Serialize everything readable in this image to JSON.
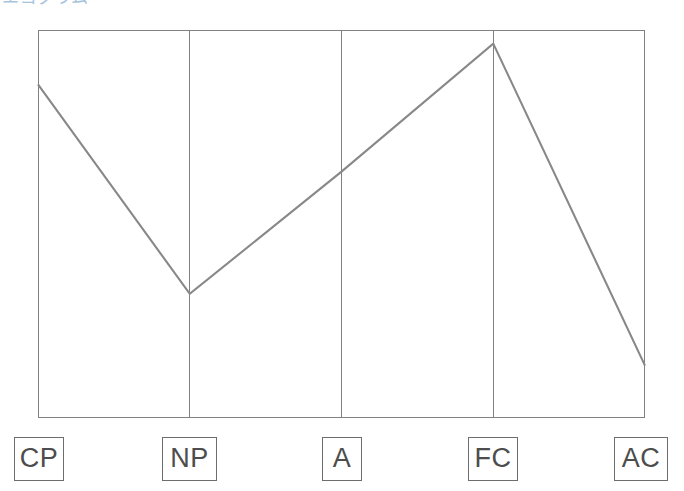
{
  "heading": {
    "text": "エゴグラム"
  },
  "chart_data": {
    "type": "line",
    "title": "エゴグラム",
    "xlabel": "",
    "ylabel": "",
    "categories": [
      "CP",
      "NP",
      "A",
      "FC",
      "AC"
    ],
    "values": [
      17.2,
      6.4,
      12.7,
      19.3,
      2.7
    ],
    "ylim": [
      0,
      20
    ],
    "grid": "vertical-category-dividers",
    "legend": "none",
    "line_color": "#888888",
    "frame_color": "#808080",
    "background": "#ffffff"
  },
  "axis_labels": [
    {
      "label": "CP",
      "left": 14,
      "width": 50
    },
    {
      "label": "NP",
      "left": 162,
      "width": 55
    },
    {
      "label": "A",
      "left": 322,
      "width": 40
    },
    {
      "label": "FC",
      "left": 468,
      "width": 50
    },
    {
      "label": "AC",
      "left": 614,
      "width": 54
    }
  ]
}
